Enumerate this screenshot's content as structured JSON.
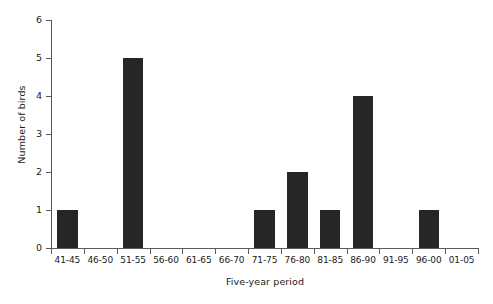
{
  "chart_data": {
    "type": "bar",
    "title": "",
    "xlabel": "Five-year period",
    "ylabel": "Number of birds",
    "categories": [
      "41-45",
      "46-50",
      "51-55",
      "56-60",
      "61-65",
      "66-70",
      "71-75",
      "76-80",
      "81-85",
      "86-90",
      "91-95",
      "96-00",
      "01-05"
    ],
    "values": [
      1,
      0,
      5,
      0,
      0,
      0,
      1,
      2,
      1,
      4,
      0,
      1,
      0
    ],
    "ylim": [
      0,
      6
    ],
    "y_ticks": [
      "0",
      "1",
      "2",
      "3",
      "4",
      "5",
      "6"
    ],
    "y_tick_values": [
      0,
      1,
      2,
      3,
      4,
      5,
      6
    ],
    "grid": false,
    "legend": "none",
    "bar_color": "#262626",
    "axis_color": "#5a5a5a",
    "background": "#ffffff"
  }
}
